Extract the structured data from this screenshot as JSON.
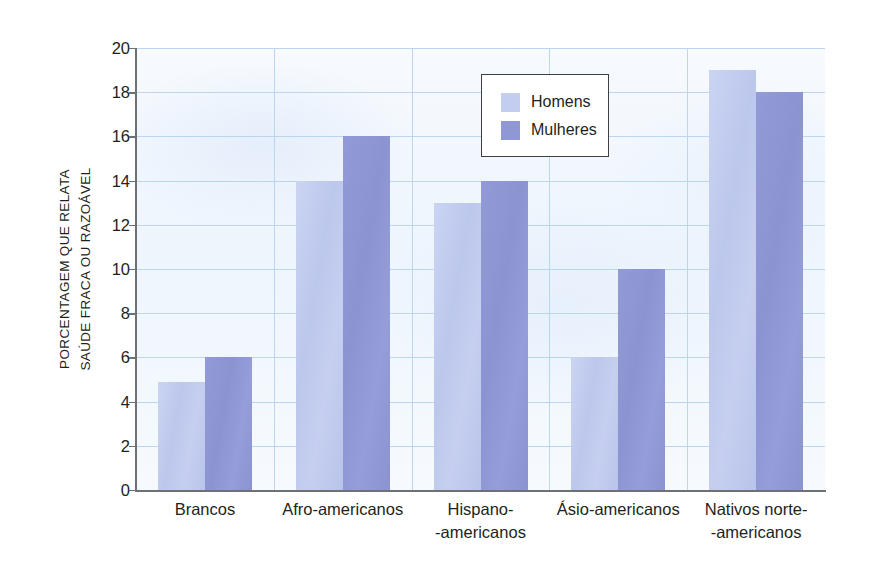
{
  "chart_data": {
    "type": "bar",
    "title": "",
    "xlabel": "",
    "ylabel_line1": "PORCENTAGEM QUE RELATA",
    "ylabel_line2": "SAÚDE FRACA OU RAZOÁVEL",
    "ylim": [
      0,
      20
    ],
    "ytick_labels": [
      "0",
      "2",
      "4",
      "6",
      "8",
      "10",
      "12",
      "14",
      "16",
      "18",
      "20"
    ],
    "ytick_values": [
      0,
      2,
      4,
      6,
      8,
      10,
      12,
      14,
      16,
      18,
      20
    ],
    "grid": "horizontal-and-vertical",
    "legend_position": "top-center",
    "categories": [
      "Brancos",
      "Afro-americanos",
      "Hispano--americanos",
      "Ásio-americanos",
      "Nativos norte--americanos"
    ],
    "category_lines": [
      [
        "Brancos",
        ""
      ],
      [
        "Afro-americanos",
        ""
      ],
      [
        "Hispano-",
        "-americanos"
      ],
      [
        "Ásio-americanos",
        ""
      ],
      [
        "Nativos norte-",
        "-americanos"
      ]
    ],
    "series": [
      {
        "name": "Homens",
        "color": "#c3cdf0",
        "values": [
          4.9,
          14,
          13,
          6,
          19
        ]
      },
      {
        "name": "Mulheres",
        "color": "#8f97d4",
        "values": [
          6,
          16,
          14,
          10,
          18
        ]
      }
    ]
  },
  "legend": {
    "entries": [
      {
        "label": "Homens",
        "color": "#c3cdf0"
      },
      {
        "label": "Mulheres",
        "color": "#8f97d4"
      }
    ]
  },
  "colors": {
    "plot_background": "#f4f8fe",
    "gridline": "#b9d3ee",
    "axis": "#6f7072",
    "text": "#231f20",
    "legend_border": "#3e3f41"
  }
}
